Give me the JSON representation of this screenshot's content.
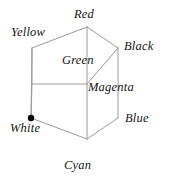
{
  "figure": {
    "background_color": "#ffffff",
    "edge_color": "#9a9a9a",
    "text_color": "#141414",
    "marker_color": "#000000"
  },
  "chart_data": {
    "type": "diagram",
    "subtype": "isometric-wireframe-cube",
    "title": "",
    "xlabel": "",
    "ylabel": "",
    "projection": "isometric",
    "vertices": [
      {
        "id": "red",
        "label": "Red",
        "x": 87,
        "y": 27,
        "marker": false,
        "label_position": "above"
      },
      {
        "id": "yellow",
        "label": "Yellow",
        "x": 32,
        "y": 48,
        "marker": false,
        "label_position": "upper-left"
      },
      {
        "id": "black",
        "label": "Black",
        "x": 118,
        "y": 48,
        "marker": false,
        "label_position": "right"
      },
      {
        "id": "green",
        "label": "Green",
        "x": 32,
        "y": 84,
        "marker": false,
        "label_position": "inside-top-face"
      },
      {
        "id": "magenta",
        "label": "Magenta",
        "x": 87,
        "y": 84,
        "marker": false,
        "label_position": "right"
      },
      {
        "id": "white",
        "label": "White",
        "x": 31,
        "y": 118,
        "marker": true,
        "label_position": "below-left"
      },
      {
        "id": "blue",
        "label": "Blue",
        "x": 118,
        "y": 118,
        "marker": false,
        "label_position": "right"
      },
      {
        "id": "cyan",
        "label": "Cyan",
        "x": 87,
        "y": 139,
        "marker": false,
        "label_position": "below"
      }
    ],
    "edges": [
      [
        "red",
        "yellow"
      ],
      [
        "red",
        "black"
      ],
      [
        "red",
        "magenta"
      ],
      [
        "yellow",
        "green"
      ],
      [
        "yellow",
        "white"
      ],
      [
        "black",
        "magenta"
      ],
      [
        "black",
        "blue"
      ],
      [
        "magenta",
        "cyan"
      ],
      [
        "green",
        "white"
      ],
      [
        "green",
        "magenta"
      ],
      [
        "white",
        "cyan"
      ],
      [
        "blue",
        "cyan"
      ]
    ],
    "markers": [
      {
        "vertex": "white",
        "shape": "filled-circle",
        "radius": 3.2,
        "color": "#000000"
      }
    ],
    "labels": {
      "red": "Red",
      "yellow": "Yellow",
      "black": "Black",
      "green": "Green",
      "magenta": "Magenta",
      "white": "White",
      "blue": "Blue",
      "cyan": "Cyan"
    },
    "legend": null,
    "grid": false
  }
}
